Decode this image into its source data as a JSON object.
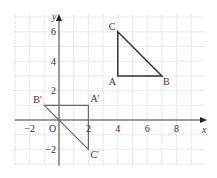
{
  "diagram": {
    "title": "",
    "axes": {
      "x_label": "x",
      "y_label": "y",
      "origin_label": "O",
      "x_ticks": [
        {
          "value": -2,
          "label": "−2"
        },
        {
          "value": 2,
          "label": "2"
        },
        {
          "value": 4,
          "label": "4"
        },
        {
          "value": 6,
          "label": "6"
        },
        {
          "value": 8,
          "label": "8"
        }
      ],
      "y_ticks": [
        {
          "value": 6,
          "label": "6"
        },
        {
          "value": 4,
          "label": "4"
        },
        {
          "value": 2,
          "label": "2"
        },
        {
          "value": -2,
          "label": "−2"
        }
      ],
      "x_range": [
        -3,
        10
      ],
      "y_range": [
        -3,
        7
      ]
    },
    "triangles": [
      {
        "name": "ABC",
        "color": "#333333",
        "vertices": [
          {
            "label": "A",
            "x": 4,
            "y": 3
          },
          {
            "label": "B",
            "x": 7,
            "y": 3
          },
          {
            "label": "C",
            "x": 4,
            "y": 6
          }
        ]
      },
      {
        "name": "A'B'C'",
        "color": "#666666",
        "vertices": [
          {
            "label": "A'",
            "x": 2,
            "y": 1
          },
          {
            "label": "B'",
            "x": -1,
            "y": 1
          },
          {
            "label": "C'",
            "x": 2,
            "y": -2
          }
        ]
      }
    ]
  },
  "chart_data": {
    "type": "scatter",
    "title": "",
    "xlabel": "x",
    "ylabel": "y",
    "xlim": [
      -3,
      10
    ],
    "ylim": [
      -3,
      7
    ],
    "grid": true,
    "series": [
      {
        "name": "Triangle ABC",
        "points": [
          {
            "label": "A",
            "x": 4,
            "y": 3
          },
          {
            "label": "B",
            "x": 7,
            "y": 3
          },
          {
            "label": "C",
            "x": 4,
            "y": 6
          }
        ]
      },
      {
        "name": "Triangle A'B'C'",
        "points": [
          {
            "label": "A'",
            "x": 2,
            "y": 1
          },
          {
            "label": "B'",
            "x": -1,
            "y": 1
          },
          {
            "label": "C'",
            "x": 2,
            "y": -2
          }
        ]
      }
    ]
  }
}
